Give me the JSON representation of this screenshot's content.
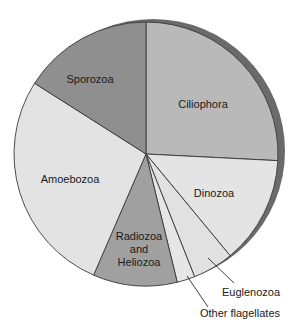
{
  "chart_data": {
    "type": "pie",
    "title": "",
    "start_angle_deg": 0,
    "direction": "clockwise",
    "center": [
      146,
      154
    ],
    "radius": 132,
    "shadow": {
      "dx": 7,
      "dy": -3,
      "color": "#6a6a6a"
    },
    "slices": [
      {
        "label": "Ciliophora",
        "value": 25.8,
        "color": "#b9b9b9",
        "label_pos": [
          203,
          108
        ],
        "lines": [
          "Ciliophora"
        ]
      },
      {
        "label": "Dinozoa",
        "value": 13.2,
        "color": "#e4e4e4",
        "label_pos": [
          214,
          197
        ],
        "lines": [
          "Dinozoa"
        ]
      },
      {
        "label": "Euglenozoa",
        "value": 5.0,
        "color": "#e1e1e1",
        "label_pos": [
          251,
          296
        ],
        "lines": [
          "Euglenozoa"
        ],
        "leader": [
          [
            208,
            258
          ],
          [
            234,
            283
          ]
        ]
      },
      {
        "label": "Other flagellates",
        "value": 2.2,
        "color": "#e6e6e6",
        "label_pos": [
          240,
          317
        ],
        "lines": [
          "Other flagellates"
        ],
        "leader": [
          [
            187,
            276
          ],
          [
            208,
            307
          ]
        ]
      },
      {
        "label": "Radiozoa and Heliozoa",
        "value": 10.3,
        "color": "#a0a0a0",
        "label_pos": [
          139,
          240
        ],
        "lines": [
          "Radiozoa",
          "and",
          "Heliozoa"
        ]
      },
      {
        "label": "Amoebozoa",
        "value": 27.5,
        "color": "#e3e3e3",
        "label_pos": [
          70,
          183
        ],
        "lines": [
          "Amoebozoa"
        ]
      },
      {
        "label": "Sporozoa",
        "value": 16.0,
        "color": "#8f8f8f",
        "label_pos": [
          90,
          83
        ],
        "lines": [
          "Sporozoa"
        ]
      }
    ],
    "legend": null,
    "units": "percent (estimated from angles)"
  }
}
